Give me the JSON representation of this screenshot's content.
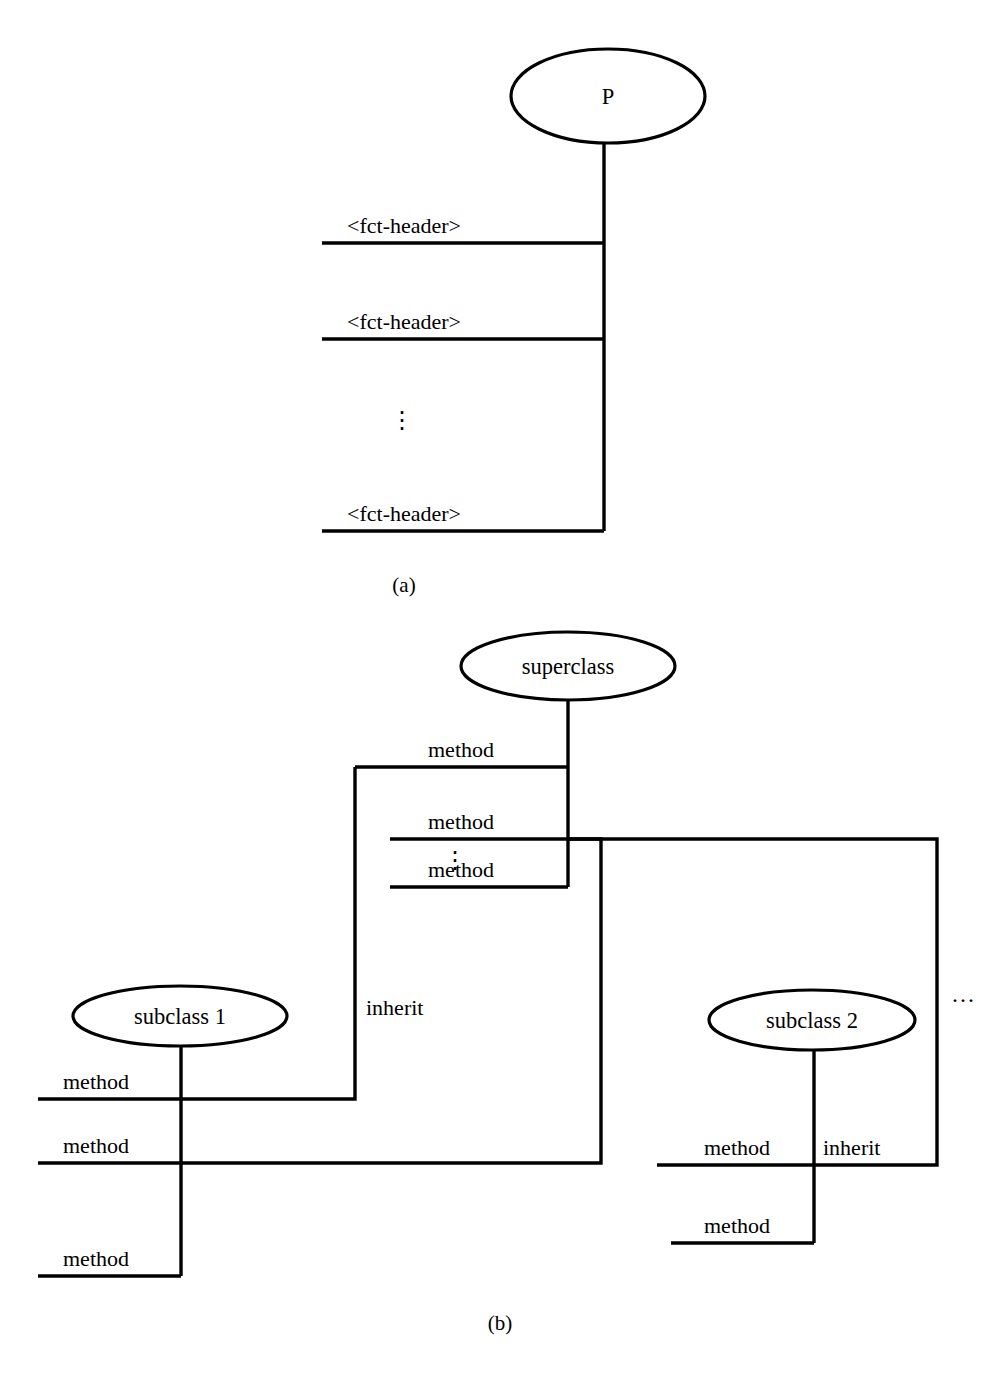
{
  "figure": {
    "title": "",
    "panels": [
      {
        "caption": "(a)",
        "root_node": "P",
        "edge_labels": [
          "<fct-header>",
          "<fct-header>",
          "<fct-header>"
        ],
        "vertical_ellipsis": "⋮"
      },
      {
        "caption": "(b)",
        "nodes": {
          "superclass": "superclass",
          "subclass1": "subclass 1",
          "subclass2": "subclass 2"
        },
        "superclass_methods": [
          "method",
          "method",
          "method"
        ],
        "superclass_ellipsis": "⋮",
        "subclass1_methods": [
          "method",
          "method",
          "method"
        ],
        "subclass2_methods": [
          "method",
          "method"
        ],
        "inherit_labels": [
          "inherit",
          "inherit"
        ],
        "more_subclasses": "···"
      }
    ]
  },
  "panel_a": {
    "node_label": "P",
    "header1": "<fct-header>",
    "header2": "<fct-header>",
    "header3": "<fct-header>",
    "ellipsis": "⋮",
    "caption": "(a)"
  },
  "panel_b": {
    "superclass_label": "superclass",
    "subclass1_label": "subclass 1",
    "subclass2_label": "subclass 2",
    "sc_method1": "method",
    "sc_method2": "method",
    "sc_method3": "method",
    "sc_ellipsis": "⋮",
    "s1_method1": "method",
    "s1_method2": "method",
    "s1_method3": "method",
    "s2_method1": "method",
    "s2_method2": "method",
    "inherit1": "inherit",
    "inherit2": "inherit",
    "more": "···",
    "caption": "(b)"
  },
  "colors": {
    "stroke": "#000000",
    "background": "#ffffff",
    "text": "#000000"
  }
}
